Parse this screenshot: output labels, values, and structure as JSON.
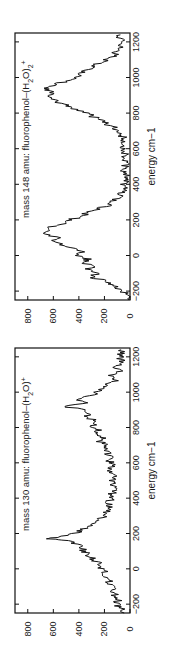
{
  "chart_data": [
    {
      "type": "line",
      "orientation": "rotated-90-ccw",
      "title": "mass 148 amu: fluorophenol-(H2O)2+",
      "title_parts": {
        "prefix": "mass 148 amu: fluorophenol–(H",
        "sub": "2",
        "mid": "O)",
        "sub2": "2",
        "sup": "+"
      },
      "xlabel": "energy  cm−1",
      "ylabel": "",
      "xlim": [
        -250,
        1250
      ],
      "ylim": [
        0,
        900
      ],
      "xticks": [
        -200,
        0,
        200,
        400,
        600,
        800,
        1000,
        1200
      ],
      "xtick_labels": [
        "−200",
        "0",
        "200",
        "400",
        "600",
        "800",
        "1000",
        "1200"
      ],
      "yticks": [
        0,
        200,
        400,
        600,
        800
      ],
      "ytick_labels": [
        "0",
        "200",
        "400",
        "600",
        "800"
      ],
      "grid": false,
      "series": [
        {
          "name": "mass 148",
          "x": [
            -250,
            -220,
            -200,
            -180,
            -160,
            -140,
            -120,
            -100,
            -80,
            -60,
            -40,
            -20,
            0,
            20,
            40,
            60,
            80,
            100,
            120,
            140,
            160,
            180,
            200,
            220,
            240,
            260,
            280,
            300,
            320,
            340,
            360,
            380,
            400,
            420,
            440,
            460,
            480,
            500,
            520,
            540,
            560,
            580,
            600,
            620,
            640,
            660,
            680,
            700,
            720,
            740,
            760,
            780,
            800,
            820,
            840,
            860,
            880,
            900,
            920,
            940,
            960,
            980,
            1000,
            1020,
            1040,
            1060,
            1080,
            1100,
            1120,
            1140,
            1160,
            1180,
            1200,
            1220,
            1240
          ],
          "y": [
            10,
            25,
            60,
            110,
            160,
            210,
            300,
            250,
            330,
            280,
            380,
            320,
            420,
            380,
            460,
            520,
            600,
            560,
            680,
            600,
            640,
            520,
            470,
            380,
            330,
            260,
            180,
            140,
            110,
            80,
            60,
            50,
            55,
            40,
            45,
            30,
            50,
            40,
            35,
            60,
            30,
            45,
            40,
            55,
            35,
            50,
            70,
            90,
            130,
            180,
            230,
            290,
            340,
            420,
            480,
            560,
            620,
            650,
            600,
            680,
            600,
            500,
            420,
            380,
            340,
            300,
            240,
            180,
            120,
            110,
            90,
            70,
            60,
            80,
            75
          ]
        }
      ]
    },
    {
      "type": "line",
      "orientation": "rotated-90-ccw",
      "title": "mass 130 amu: fluorophenol-(H2O)+",
      "title_parts": {
        "prefix": "mass 130 amu: fluorophenol–(H",
        "sub": "2",
        "mid": "O)",
        "sub2": "",
        "sup": "+"
      },
      "xlabel": "energy  cm−1",
      "ylabel": "",
      "xlim": [
        -250,
        1250
      ],
      "ylim": [
        0,
        900
      ],
      "xticks": [
        -200,
        0,
        200,
        400,
        600,
        800,
        1000,
        1200
      ],
      "xtick_labels": [
        "−200",
        "0",
        "200",
        "400",
        "600",
        "800",
        "1000",
        "1200"
      ],
      "yticks": [
        0,
        200,
        400,
        600,
        800
      ],
      "ytick_labels": [
        "0",
        "200",
        "400",
        "600",
        "800"
      ],
      "grid": false,
      "series": [
        {
          "name": "mass 130",
          "x": [
            -250,
            -220,
            -200,
            -180,
            -160,
            -140,
            -120,
            -100,
            -80,
            -60,
            -40,
            -20,
            0,
            20,
            40,
            60,
            80,
            100,
            120,
            140,
            160,
            170,
            180,
            200,
            220,
            240,
            260,
            280,
            300,
            320,
            340,
            360,
            380,
            400,
            420,
            440,
            460,
            480,
            500,
            520,
            540,
            560,
            580,
            600,
            620,
            640,
            660,
            680,
            700,
            720,
            740,
            760,
            780,
            800,
            820,
            840,
            860,
            880,
            900,
            920,
            940,
            960,
            980,
            1000,
            1020,
            1040,
            1060,
            1080,
            1100,
            1120,
            1140,
            1160,
            1180,
            1200,
            1220,
            1240
          ],
          "y": [
            80,
            70,
            110,
            90,
            130,
            120,
            150,
            140,
            170,
            160,
            200,
            190,
            220,
            240,
            260,
            300,
            320,
            360,
            380,
            420,
            480,
            620,
            560,
            440,
            380,
            320,
            260,
            240,
            200,
            190,
            170,
            150,
            160,
            140,
            150,
            130,
            140,
            135,
            150,
            130,
            160,
            140,
            150,
            145,
            170,
            150,
            180,
            190,
            200,
            230,
            210,
            260,
            250,
            280,
            300,
            290,
            330,
            320,
            350,
            520,
            340,
            400,
            300,
            260,
            210,
            180,
            120,
            110,
            150,
            90,
            100,
            85,
            70,
            80,
            75,
            70
          ]
        }
      ]
    }
  ]
}
